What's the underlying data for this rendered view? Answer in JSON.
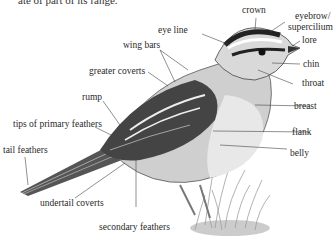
{
  "caption_fragment": "ate of part of its range.",
  "labels": {
    "crown": "crown",
    "eyebrow": "eyebrow/",
    "supercilium": "supercilium",
    "eye_line": "eye line",
    "lore": "lore",
    "wing_bars": "wing bars",
    "chin": "chin",
    "greater_coverts": "greater coverts",
    "throat": "throat",
    "rump": "rump",
    "breast": "breast",
    "tips_primary": "tips of primary feathers",
    "flank": "flank",
    "tail_feathers": "tail feathers",
    "belly": "belly",
    "undertail_coverts": "undertail coverts",
    "secondary_feathers": "secondary feathers"
  }
}
